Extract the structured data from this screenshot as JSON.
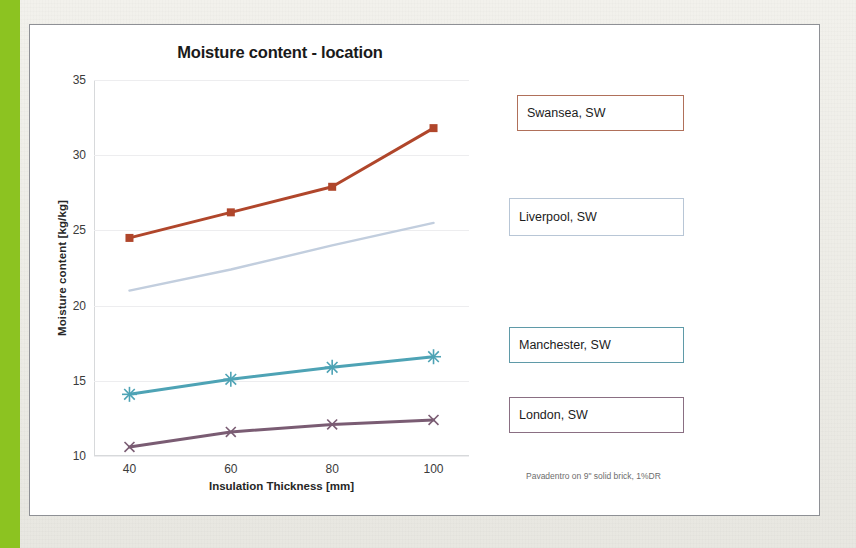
{
  "slide": {
    "accent_bar_color": "#8cc321",
    "card_background": "#ffffff",
    "backdrop_color": "#efeee9"
  },
  "chart_data": {
    "type": "line",
    "title": "Moisture content - location",
    "xlabel": "Insulation Thickness [mm]",
    "ylabel": "Moisture content [kg/kg]",
    "annotation": "Pavadentro on 9\" solid brick, 1%DR",
    "x": [
      40,
      60,
      80,
      100
    ],
    "xticks": [
      "40",
      "60",
      "80",
      "100"
    ],
    "yticks": [
      "10",
      "15",
      "20",
      "25",
      "30",
      "35"
    ],
    "xlim": [
      33,
      107
    ],
    "ylim": [
      10,
      35
    ],
    "grid": "horizontal",
    "legend_position": "right-callouts",
    "series": [
      {
        "name": "Swansea, SW",
        "color": "#b0462b",
        "marker": "square",
        "values": [
          24.5,
          26.2,
          27.9,
          31.8
        ]
      },
      {
        "name": "Liverpool, SW",
        "color": "#c2cede",
        "marker": "none",
        "values": [
          21.0,
          22.4,
          24.0,
          25.5
        ]
      },
      {
        "name": "Manchester, SW",
        "color": "#4ea3b5",
        "marker": "asterisk",
        "values": [
          14.1,
          15.1,
          15.9,
          16.6
        ]
      },
      {
        "name": "London, SW",
        "color": "#7a5c73",
        "marker": "cross",
        "values": [
          10.6,
          11.6,
          12.1,
          12.4
        ]
      }
    ]
  },
  "legend_boxes": [
    {
      "label": "Swansea, SW",
      "border_color": "#b0705a",
      "left": 516,
      "top": 94,
      "width": 167,
      "height": 36
    },
    {
      "label": "Liverpool, SW",
      "border_color": "#b8c6d6",
      "left": 508,
      "top": 197,
      "width": 175,
      "height": 38
    },
    {
      "label": "Manchester, SW",
      "border_color": "#5f9aa8",
      "left": 508,
      "top": 326,
      "width": 175,
      "height": 36
    },
    {
      "label": "London, SW",
      "border_color": "#8a6f83",
      "left": 508,
      "top": 396,
      "width": 175,
      "height": 36
    }
  ]
}
